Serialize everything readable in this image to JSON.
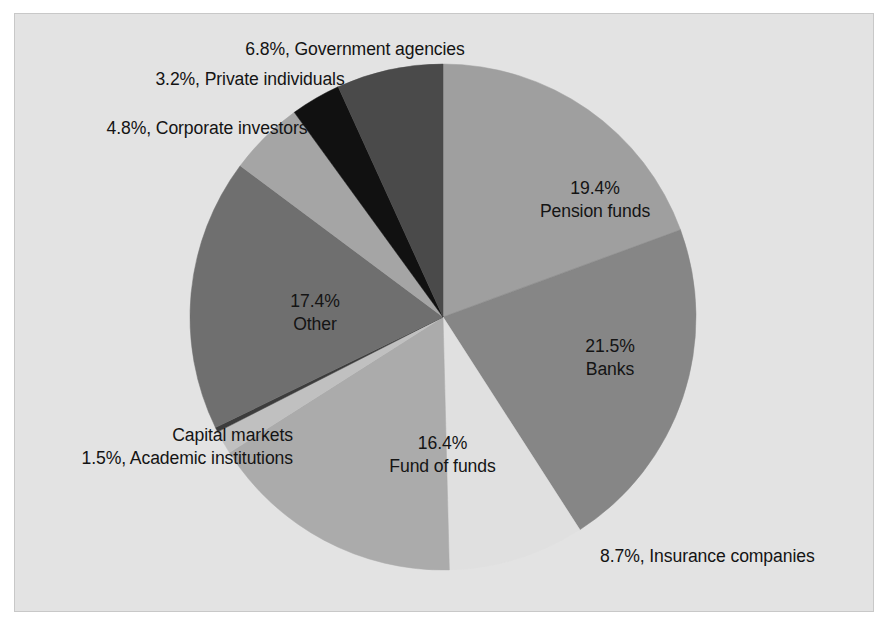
{
  "figure": {
    "background_color": "#e3e3e3",
    "frame_border_color": "#c8c8c8",
    "text_color": "#141414"
  },
  "chart_data": {
    "type": "pie",
    "title": "",
    "subtitle": "",
    "xlabel": "",
    "ylabel": "",
    "legend_position": "none",
    "grid": false,
    "start_angle_deg": 0,
    "direction": "clockwise",
    "units": "percent",
    "total": 100,
    "categories": [
      "Pension funds",
      "Banks",
      "Insurance companies",
      "Fund of funds",
      "Academic institutions",
      "Capital markets",
      "Other",
      "Corporate investors",
      "Private individuals",
      "Government agencies"
    ],
    "values": [
      19.4,
      21.5,
      8.7,
      16.4,
      1.5,
      0.3,
      17.4,
      4.8,
      3.2,
      6.8
    ],
    "colors": [
      "#9f9f9f",
      "#868686",
      "#e0e0e0",
      "#ababab",
      "#c0c0c0",
      "#3c3c3c",
      "#6f6f6f",
      "#a5a5a5",
      "#111111",
      "#4a4a4a"
    ],
    "slices": [
      {
        "id": "pension-funds",
        "label": "Pension funds",
        "percent_text": "19.4%",
        "value": 19.4,
        "color": "#9f9f9f",
        "label_placement": "inside"
      },
      {
        "id": "banks",
        "label": "Banks",
        "percent_text": "21.5%",
        "value": 21.5,
        "color": "#868686",
        "label_placement": "inside"
      },
      {
        "id": "insurance-companies",
        "label": "Insurance companies",
        "percent_text": "8.7%",
        "value": 8.7,
        "color": "#e0e0e0",
        "label_placement": "outside"
      },
      {
        "id": "fund-of-funds",
        "label": "Fund of funds",
        "percent_text": "16.4%",
        "value": 16.4,
        "color": "#ababab",
        "label_placement": "inside"
      },
      {
        "id": "academic-institutions",
        "label": "Academic institutions",
        "percent_text": "1.5%",
        "value": 1.5,
        "color": "#c0c0c0",
        "label_placement": "outside"
      },
      {
        "id": "capital-markets",
        "label": "Capital markets",
        "percent_text": "",
        "value": 0.3,
        "color": "#3c3c3c",
        "label_placement": "outside"
      },
      {
        "id": "other",
        "label": "Other",
        "percent_text": "17.4%",
        "value": 17.4,
        "color": "#6f6f6f",
        "label_placement": "inside"
      },
      {
        "id": "corporate-investors",
        "label": "Corporate investors",
        "percent_text": "4.8%",
        "value": 4.8,
        "color": "#a5a5a5",
        "label_placement": "outside"
      },
      {
        "id": "private-individuals",
        "label": "Private individuals",
        "percent_text": "3.2%",
        "value": 3.2,
        "color": "#111111",
        "label_placement": "outside"
      },
      {
        "id": "government-agencies",
        "label": "Government agencies",
        "percent_text": "6.8%",
        "value": 6.8,
        "color": "#4a4a4a",
        "label_placement": "outside"
      }
    ]
  },
  "labels": {
    "government_agencies": "6.8%, Government agencies",
    "private_individuals": "3.2%, Private individuals",
    "corporate_investors": "4.8%, Corporate investors",
    "pension_funds_pct": "19.4%",
    "pension_funds_name": "Pension funds",
    "banks_pct": "21.5%",
    "banks_name": "Banks",
    "insurance_companies": "8.7%, Insurance companies",
    "other_pct": "17.4%",
    "other_name": "Other",
    "fund_of_funds_pct": "16.4%",
    "fund_of_funds_name": "Fund of funds",
    "capital_markets": "Capital markets",
    "academic_institutions": "1.5%, Academic institutions"
  }
}
